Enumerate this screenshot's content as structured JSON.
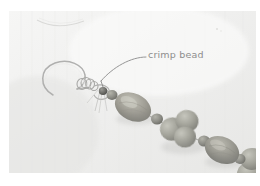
{
  "figure": {
    "kind": "photograph-with-annotation",
    "width_px": 260,
    "height_px": 186
  },
  "photo": {
    "background_color": "#f1f1f0",
    "paper_tint": "#ececeb",
    "left_px": 9,
    "top_px": 11,
    "width_px": 247,
    "height_px": 162
  },
  "annotation": {
    "label": "crimp bead",
    "text_color": "#8d8d8d",
    "leader_color": "#8a8a8a",
    "leader_start_x": 146,
    "leader_start_y": 57,
    "leader_end_x": 101,
    "leader_end_y": 87
  },
  "jewelry": {
    "ear_wire": {
      "name": "fish-hook ear wire",
      "color": "#b9b9b8",
      "highlight": "#e8e8e7"
    },
    "crimp_bead": {
      "name": "crimp bead",
      "color": "#6a6a68"
    },
    "beads": [
      {
        "name": "spacer-bead-1",
        "shape": "round",
        "color": "#a9a9a2",
        "cx": 110,
        "cy": 88,
        "rx": 6,
        "ry": 5.5
      },
      {
        "name": "oval-bead-1",
        "shape": "oval",
        "color": "#9b9a92",
        "cx": 131,
        "cy": 100,
        "rx": 18,
        "ry": 13
      },
      {
        "name": "spacer-bead-2",
        "shape": "round",
        "color": "#8f8f89",
        "cx": 152,
        "cy": 111,
        "rx": 6,
        "ry": 5.5
      },
      {
        "name": "round-bead-cluster-1",
        "shape": "round",
        "color": "#9d9d94",
        "cx": 167,
        "cy": 113,
        "rx": 11,
        "ry": 10
      },
      {
        "name": "round-bead-cluster-2",
        "shape": "round",
        "color": "#a2a299",
        "cx": 172,
        "cy": 128,
        "rx": 11,
        "ry": 11
      },
      {
        "name": "round-bead-cluster-3",
        "shape": "round",
        "color": "#96968e",
        "cx": 185,
        "cy": 120,
        "rx": 10,
        "ry": 10
      },
      {
        "name": "spacer-bead-3",
        "shape": "round",
        "color": "#8c8c86",
        "cx": 199,
        "cy": 133,
        "rx": 6,
        "ry": 5.5
      },
      {
        "name": "oval-bead-2",
        "shape": "oval",
        "color": "#95958d",
        "cx": 219,
        "cy": 143,
        "rx": 17,
        "ry": 12.5
      },
      {
        "name": "spacer-bead-4",
        "shape": "round",
        "color": "#85857f",
        "cx": 239,
        "cy": 153,
        "rx": 6,
        "ry": 5.5
      },
      {
        "name": "round-bead-cluster-4",
        "shape": "round",
        "color": "#9a9a92",
        "cx": 252,
        "cy": 158,
        "rx": 11,
        "ry": 10
      },
      {
        "name": "round-bead-cluster-5",
        "shape": "round",
        "color": "#90908a",
        "cx": 250,
        "cy": 172,
        "rx": 11,
        "ry": 11
      }
    ],
    "thread_color": "#9a9a96"
  },
  "paper_marks": {
    "crease": {
      "name": "paper-crease",
      "color": "#d8d8d6"
    },
    "speck": {
      "name": "paper-speck",
      "color": "#dcdcda"
    }
  }
}
